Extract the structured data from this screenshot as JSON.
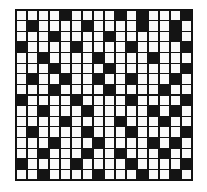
{
  "figure": {
    "background_color": "#ffffff",
    "frame_color": "#111111",
    "cell_black_color": "#141414",
    "cell_white_color": "#fbfbfb",
    "grid_line_color": "#141414"
  },
  "chart_data": {
    "type": "heatmap",
    "title": "",
    "subtitle": "",
    "xlabel": "",
    "ylabel": "",
    "rows": 16,
    "columns": 16,
    "grid": true,
    "legend": "none",
    "value_labels": {
      "0": "white",
      "1": "black"
    },
    "colors": {
      "0": "#fbfbfb",
      "1": "#141414"
    },
    "matrix": [
      [
        0,
        0,
        0,
        0,
        1,
        0,
        0,
        0,
        0,
        1,
        0,
        1,
        0,
        0,
        0,
        1
      ],
      [
        0,
        1,
        0,
        0,
        0,
        0,
        1,
        0,
        0,
        0,
        0,
        1,
        0,
        0,
        1,
        0
      ],
      [
        0,
        0,
        0,
        1,
        0,
        0,
        0,
        0,
        1,
        0,
        0,
        0,
        0,
        0,
        1,
        0
      ],
      [
        1,
        0,
        0,
        0,
        0,
        1,
        0,
        0,
        0,
        0,
        1,
        0,
        0,
        0,
        0,
        1
      ],
      [
        0,
        0,
        1,
        0,
        0,
        0,
        0,
        1,
        0,
        0,
        0,
        0,
        1,
        0,
        0,
        0
      ],
      [
        0,
        0,
        0,
        1,
        0,
        0,
        0,
        0,
        1,
        0,
        0,
        0,
        0,
        0,
        0,
        1
      ],
      [
        0,
        1,
        0,
        0,
        1,
        0,
        0,
        1,
        0,
        0,
        1,
        0,
        0,
        0,
        1,
        0
      ],
      [
        0,
        0,
        0,
        1,
        0,
        0,
        0,
        0,
        1,
        0,
        0,
        0,
        0,
        1,
        0,
        0
      ],
      [
        1,
        0,
        0,
        0,
        0,
        1,
        0,
        0,
        0,
        0,
        1,
        0,
        0,
        0,
        0,
        1
      ],
      [
        0,
        0,
        1,
        0,
        0,
        0,
        1,
        0,
        0,
        0,
        0,
        0,
        1,
        0,
        1,
        0
      ],
      [
        0,
        0,
        0,
        0,
        1,
        0,
        0,
        0,
        0,
        1,
        0,
        0,
        0,
        1,
        0,
        0
      ],
      [
        0,
        1,
        0,
        0,
        0,
        0,
        1,
        0,
        0,
        0,
        1,
        0,
        0,
        0,
        0,
        1
      ],
      [
        0,
        0,
        0,
        1,
        0,
        0,
        0,
        1,
        0,
        0,
        0,
        0,
        1,
        0,
        1,
        0
      ],
      [
        0,
        0,
        1,
        0,
        0,
        0,
        1,
        0,
        0,
        1,
        0,
        0,
        0,
        1,
        0,
        0
      ],
      [
        1,
        0,
        0,
        0,
        0,
        1,
        0,
        0,
        0,
        0,
        1,
        0,
        0,
        0,
        0,
        1
      ],
      [
        0,
        0,
        1,
        0,
        0,
        0,
        0,
        1,
        0,
        0,
        0,
        1,
        0,
        0,
        1,
        0
      ]
    ]
  }
}
